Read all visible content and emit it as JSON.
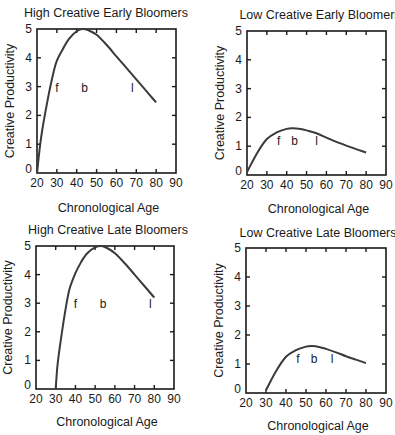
{
  "chart_data": [
    {
      "type": "line",
      "title": "High Creative Early Bloomers",
      "xlabel": "Chronological Age",
      "ylabel": "Creative Productivity",
      "xlim": [
        20,
        90
      ],
      "ylim": [
        0,
        5
      ],
      "xticks": [
        20,
        30,
        40,
        50,
        60,
        70,
        80,
        90
      ],
      "yticks": [
        0,
        1,
        2,
        3,
        4,
        5
      ],
      "grid": false,
      "x": [
        20,
        22,
        25,
        28,
        30,
        33,
        36,
        40,
        43,
        46,
        50,
        55,
        60,
        65,
        70,
        75,
        80
      ],
      "values": [
        0.0,
        1.2,
        2.4,
        3.4,
        3.9,
        4.3,
        4.65,
        4.92,
        5.0,
        4.95,
        4.8,
        4.45,
        4.05,
        3.65,
        3.25,
        2.85,
        2.45
      ],
      "annotations": [
        {
          "text": "f",
          "x": 30,
          "y": 3
        },
        {
          "text": "b",
          "x": 44,
          "y": 3
        },
        {
          "text": "l",
          "x": 68,
          "y": 3
        }
      ]
    },
    {
      "type": "line",
      "title": "Low Creative Early Bloomers",
      "xlabel": "Chronological Age",
      "ylabel": "Creative Productivity",
      "xlim": [
        20,
        90
      ],
      "ylim": [
        0,
        5
      ],
      "xticks": [
        20,
        30,
        40,
        50,
        60,
        70,
        80,
        90
      ],
      "yticks": [
        0,
        1,
        2,
        3,
        4,
        5
      ],
      "grid": false,
      "x": [
        20,
        25,
        30,
        35,
        40,
        43,
        47,
        50,
        55,
        60,
        65,
        70,
        75,
        80
      ],
      "values": [
        0.1,
        0.75,
        1.25,
        1.48,
        1.6,
        1.62,
        1.6,
        1.55,
        1.45,
        1.3,
        1.15,
        1.02,
        0.9,
        0.78
      ],
      "annotations": [
        {
          "text": "f",
          "x": 36,
          "y": 1.2
        },
        {
          "text": "b",
          "x": 44,
          "y": 1.2
        },
        {
          "text": "l",
          "x": 55,
          "y": 1.2
        }
      ]
    },
    {
      "type": "line",
      "title": "High Creative Late Bloomers",
      "xlabel": "Chronological Age",
      "ylabel": "Creative Productivity",
      "xlim": [
        20,
        90
      ],
      "ylim": [
        0,
        5
      ],
      "xticks": [
        20,
        30,
        40,
        50,
        60,
        70,
        80,
        90
      ],
      "yticks": [
        0,
        1,
        2,
        3,
        4,
        5
      ],
      "grid": false,
      "x": [
        30,
        31,
        33,
        35,
        37,
        40,
        43,
        46,
        50,
        53,
        56,
        60,
        65,
        70,
        75,
        80
      ],
      "values": [
        0.0,
        0.9,
        1.9,
        2.8,
        3.5,
        4.05,
        4.45,
        4.75,
        4.95,
        5.0,
        4.93,
        4.75,
        4.4,
        4.0,
        3.6,
        3.2
      ],
      "annotations": [
        {
          "text": "f",
          "x": 40,
          "y": 3
        },
        {
          "text": "b",
          "x": 54,
          "y": 3
        },
        {
          "text": "l",
          "x": 78,
          "y": 3
        }
      ]
    },
    {
      "type": "line",
      "title": "Low Creative Late Bloomers",
      "xlabel": "Chronological Age",
      "ylabel": "Creative Productivity",
      "xlim": [
        20,
        90
      ],
      "ylim": [
        0,
        5
      ],
      "xticks": [
        20,
        30,
        40,
        50,
        60,
        70,
        80,
        90
      ],
      "yticks": [
        0,
        1,
        2,
        3,
        4,
        5
      ],
      "grid": false,
      "x": [
        30,
        35,
        40,
        45,
        50,
        53,
        57,
        60,
        65,
        70,
        75,
        80
      ],
      "values": [
        0.1,
        0.75,
        1.25,
        1.48,
        1.6,
        1.62,
        1.58,
        1.52,
        1.4,
        1.27,
        1.15,
        1.03
      ],
      "annotations": [
        {
          "text": "f",
          "x": 46,
          "y": 1.2
        },
        {
          "text": "b",
          "x": 54,
          "y": 1.2
        },
        {
          "text": "l",
          "x": 63,
          "y": 1.2
        }
      ]
    }
  ],
  "panels": [
    {
      "left": 37,
      "top": 29,
      "right": 176,
      "bottom": 173,
      "title_x": 106,
      "title_y": 17,
      "xlabel_y": 212,
      "ylabel_x": 14
    },
    {
      "left": 247,
      "top": 31,
      "right": 386,
      "bottom": 175,
      "title_x": 320,
      "title_y": 19,
      "xlabel_y": 213,
      "ylabel_x": 224
    },
    {
      "left": 36,
      "top": 246,
      "right": 174,
      "bottom": 389,
      "title_x": 108,
      "title_y": 234,
      "xlabel_y": 426,
      "ylabel_x": 12
    },
    {
      "left": 246,
      "top": 248,
      "right": 386,
      "bottom": 393,
      "title_x": 318,
      "title_y": 237,
      "xlabel_y": 430,
      "ylabel_x": 223
    }
  ],
  "style": {
    "line_color": "#3a3a3a",
    "axis_color": "#1a1a1a",
    "background": "#ffffff"
  }
}
